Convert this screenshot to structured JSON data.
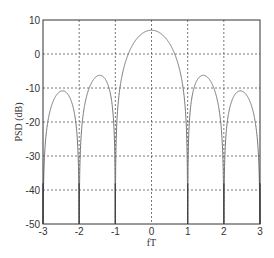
{
  "chart_data": {
    "type": "line",
    "title": "",
    "xlabel": "fT",
    "ylabel": "PSD (dB)",
    "xlim": [
      -3,
      3
    ],
    "ylim": [
      -50,
      10
    ],
    "xticks": [
      -3,
      -2,
      -1,
      0,
      1,
      2,
      3
    ],
    "yticks": [
      10,
      0,
      -10,
      -20,
      -30,
      -40,
      -50
    ],
    "grid": true,
    "series": [
      {
        "name": "PSD",
        "formula": "10*log10(5*sinc^2(fT))",
        "peak_db": 7,
        "sidelobe_peaks_db": [
          -6.5,
          -11
        ],
        "color": "#777777"
      }
    ]
  },
  "labels": {
    "xlabel": "fT",
    "ylabel": "PSD (dB)"
  }
}
